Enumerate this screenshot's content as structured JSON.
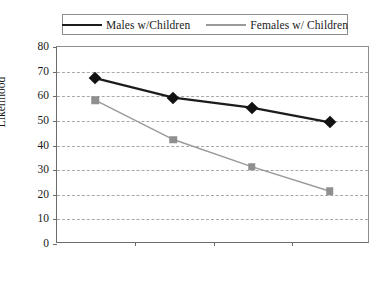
{
  "chart_data": {
    "type": "line",
    "title": "",
    "xlabel": "",
    "ylabel": "Likelihood",
    "ylim": [
      0,
      80
    ],
    "ytick_step": 10,
    "yticks": [
      80,
      70,
      60,
      50,
      40,
      30,
      20,
      10,
      0
    ],
    "grid": true,
    "legend_position": "top-center",
    "categories": [
      "$2–$3 per Serving",
      "$4–$5 per Serving",
      "$6–$7 per Serving",
      "$8–$9 per Serving"
    ],
    "category_lines": [
      [
        "$2–$3 per",
        "Serving"
      ],
      [
        "$4–$5 per",
        "Serving"
      ],
      [
        "$6–$7 per",
        "Serving"
      ],
      [
        "$8–$9 per",
        "Serving"
      ]
    ],
    "series": [
      {
        "name": "Males w/Children",
        "values": [
          67,
          59,
          55,
          49
        ],
        "color": "#1c1c1c",
        "marker": "diamond"
      },
      {
        "name": "Females w/ Children",
        "values": [
          58,
          42,
          31,
          21
        ],
        "color": "#9a9a9a",
        "marker": "square"
      }
    ]
  },
  "legend": {
    "males_label": "Males w/Children",
    "females_label": "Females w/ Children"
  },
  "axis": {
    "y_label": "Likelihood",
    "y_80": "80",
    "y_70": "70",
    "y_60": "60",
    "y_50": "50",
    "y_40": "40",
    "y_30": "30",
    "y_20": "20",
    "y_10": "10",
    "y_0": "0"
  }
}
